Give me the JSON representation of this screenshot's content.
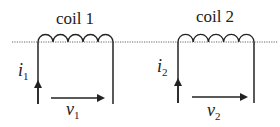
{
  "diagram": {
    "reference_line": {
      "style": "dotted",
      "color": "#555555"
    },
    "coils": [
      {
        "id": "coil1",
        "title": "coil 1",
        "turns": 5,
        "current_label": {
          "base": "i",
          "sub": "1"
        },
        "voltage_label": {
          "base": "v",
          "sub": "1"
        }
      },
      {
        "id": "coil2",
        "title": "coil 2",
        "turns": 5,
        "current_label": {
          "base": "i",
          "sub": "2"
        },
        "voltage_label": {
          "base": "v",
          "sub": "2"
        }
      }
    ],
    "colors": {
      "stroke": "#222222",
      "text": "#222222"
    }
  }
}
